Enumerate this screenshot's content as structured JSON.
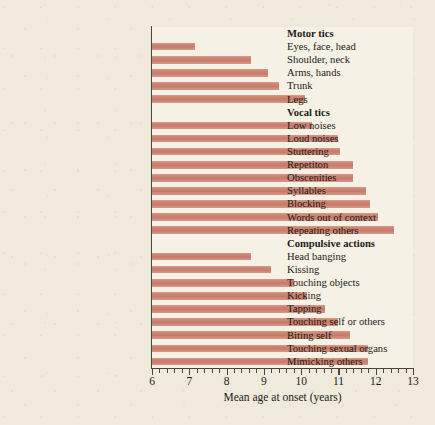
{
  "chart_data": {
    "type": "bar",
    "orientation": "horizontal",
    "title": "",
    "xlabel": "Mean age at onset (years)",
    "ylabel": "",
    "xlim": [
      6,
      13
    ],
    "xticks": [
      6,
      7,
      8,
      9,
      10,
      11,
      12,
      13
    ],
    "xtick_labels": [
      "6",
      "7",
      "8",
      "9",
      "10",
      "11",
      "12",
      "13"
    ],
    "minor_ticks": true,
    "grid": false,
    "legend": null,
    "bar_color": "#cc8172",
    "panel_color": "#f5f1e4",
    "background_color": "#efeadb",
    "groups": [
      {
        "name": "Motor tics",
        "categories": [
          "Eyes, face, head",
          "Shoulder, neck",
          "Arms, hands",
          "Trunk",
          "Legs"
        ],
        "values": [
          7.15,
          8.65,
          9.1,
          9.4,
          10.1
        ]
      },
      {
        "name": "Vocal tics",
        "categories": [
          "Low noises",
          "Loud noises",
          "Stuttering",
          "Repetiton",
          "Obscenities",
          "Syllables",
          "Blocking",
          "Words out of context",
          "Repeating others"
        ],
        "values": [
          10.3,
          11.0,
          11.05,
          11.4,
          11.4,
          11.75,
          11.85,
          12.05,
          12.5
        ]
      },
      {
        "name": "Compulsive actions",
        "categories": [
          "Head banging",
          "Kissing",
          "Touching objects",
          "Kicking",
          "Tapping",
          "Touching self or others",
          "Biting self",
          "Touching sexual organs",
          "Mimicking others"
        ],
        "values": [
          8.65,
          9.2,
          9.8,
          10.15,
          10.65,
          11.0,
          11.3,
          11.8,
          11.8
        ]
      }
    ],
    "categories": [
      "Eyes, face, head",
      "Shoulder, neck",
      "Arms, hands",
      "Trunk",
      "Legs",
      "Low noises",
      "Loud noises",
      "Stuttering",
      "Repetiton",
      "Obscenities",
      "Syllables",
      "Blocking",
      "Words out of context",
      "Repeating others",
      "Head banging",
      "Kissing",
      "Touching objects",
      "Kicking",
      "Tapping",
      "Touching self or others",
      "Biting self",
      "Touching sexual organs",
      "Mimicking others"
    ],
    "values": [
      7.15,
      8.65,
      9.1,
      9.4,
      10.1,
      10.3,
      11.0,
      11.05,
      11.4,
      11.4,
      11.75,
      11.85,
      12.05,
      12.5,
      8.65,
      9.2,
      9.8,
      10.15,
      10.65,
      11.0,
      11.3,
      11.8,
      11.8
    ]
  },
  "rows": [
    {
      "kind": "group",
      "label": "Motor tics"
    },
    {
      "kind": "item",
      "label": "Eyes, face, head",
      "value": 7.15
    },
    {
      "kind": "item",
      "label": "Shoulder, neck",
      "value": 8.65
    },
    {
      "kind": "item",
      "label": "Arms, hands",
      "value": 9.1
    },
    {
      "kind": "item",
      "label": "Trunk",
      "value": 9.4
    },
    {
      "kind": "item",
      "label": "Legs",
      "value": 10.1
    },
    {
      "kind": "group",
      "label": "Vocal tics"
    },
    {
      "kind": "item",
      "label": "Low noises",
      "value": 10.3
    },
    {
      "kind": "item",
      "label": "Loud noises",
      "value": 11.0
    },
    {
      "kind": "item",
      "label": "Stuttering",
      "value": 11.05
    },
    {
      "kind": "item",
      "label": "Repetiton",
      "value": 11.4
    },
    {
      "kind": "item",
      "label": "Obscenities",
      "value": 11.4
    },
    {
      "kind": "item",
      "label": "Syllables",
      "value": 11.75
    },
    {
      "kind": "item",
      "label": "Blocking",
      "value": 11.85
    },
    {
      "kind": "item",
      "label": "Words out of context",
      "value": 12.05
    },
    {
      "kind": "item",
      "label": "Repeating others",
      "value": 12.5
    },
    {
      "kind": "group",
      "label": "Compulsive actions"
    },
    {
      "kind": "item",
      "label": "Head banging",
      "value": 8.65
    },
    {
      "kind": "item",
      "label": "Kissing",
      "value": 9.2
    },
    {
      "kind": "item",
      "label": "Touching objects",
      "value": 9.8
    },
    {
      "kind": "item",
      "label": "Kicking",
      "value": 10.15
    },
    {
      "kind": "item",
      "label": "Tapping",
      "value": 10.65
    },
    {
      "kind": "item",
      "label": "Touching self or others",
      "value": 11.0
    },
    {
      "kind": "item",
      "label": "Biting self",
      "value": 11.3
    },
    {
      "kind": "item",
      "label": "Touching sexual organs",
      "value": 11.8
    },
    {
      "kind": "item",
      "label": "Mimicking others",
      "value": 11.8
    }
  ]
}
